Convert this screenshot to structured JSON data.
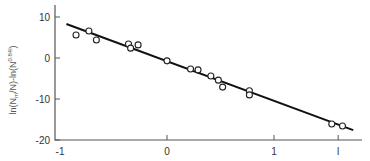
{
  "chart_data": {
    "type": "scatter",
    "title": "",
    "xlabel": "",
    "ylabel": "ln(N_m/N)-ln(N^0.84l)",
    "xlim": [
      -1,
      1.8
    ],
    "ylim": [
      -20,
      12
    ],
    "x_ticks": [
      -1,
      0,
      1,
      1.6
    ],
    "x_tick_labels": [
      "-1",
      "0",
      "1",
      "l"
    ],
    "y_ticks": [
      10,
      0,
      -10,
      -20
    ],
    "y_tick_labels": [
      "10",
      "0",
      "-10",
      "-20"
    ],
    "grid": false,
    "legend": null,
    "series": [
      {
        "name": "data",
        "marker": "open-circle",
        "points": [
          [
            -0.85,
            5.6
          ],
          [
            -0.73,
            6.6
          ],
          [
            -0.66,
            4.4
          ],
          [
            -0.36,
            3.4
          ],
          [
            -0.34,
            2.4
          ],
          [
            -0.27,
            3.2
          ],
          [
            0.0,
            -0.7
          ],
          [
            0.22,
            -2.7
          ],
          [
            0.29,
            -2.9
          ],
          [
            0.41,
            -4.4
          ],
          [
            0.48,
            -5.4
          ],
          [
            0.52,
            -7.1
          ],
          [
            0.77,
            -8.0
          ],
          [
            0.77,
            -9.0
          ],
          [
            1.54,
            -16.1
          ],
          [
            1.64,
            -16.6
          ]
        ]
      },
      {
        "name": "fit",
        "type": "line",
        "points": [
          [
            -0.94,
            8.3
          ],
          [
            1.74,
            -17.6
          ]
        ]
      }
    ]
  },
  "axes": {
    "ylabel_main": "ln(N",
    "ylabel_sub1": "m",
    "ylabel_mid": "/N)-ln(N",
    "ylabel_sup": "0.84l",
    "ylabel_end": ")"
  }
}
